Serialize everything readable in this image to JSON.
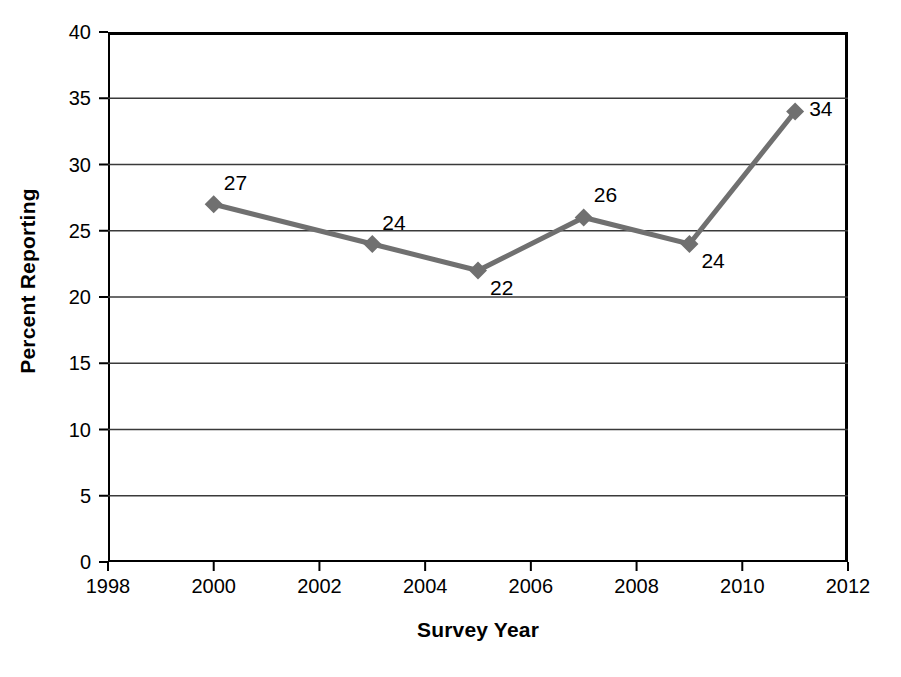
{
  "chart_data": {
    "type": "line",
    "title": "",
    "xlabel": "Survey Year",
    "ylabel": "Percent Reporting",
    "x": [
      2000,
      2003,
      2005,
      2007,
      2009,
      2011
    ],
    "values": [
      27,
      24,
      22,
      26,
      24,
      34
    ],
    "point_labels": [
      "27",
      "24",
      "22",
      "26",
      "24",
      "34"
    ],
    "xlim": [
      1998,
      2012
    ],
    "ylim": [
      0,
      40
    ],
    "xticks": [
      1998,
      2000,
      2002,
      2004,
      2006,
      2008,
      2010,
      2012
    ],
    "xtick_labels": [
      "1998",
      "2000",
      "2002",
      "2004",
      "2006",
      "2008",
      "2010",
      "2012"
    ],
    "yticks": [
      0,
      5,
      10,
      15,
      20,
      25,
      30,
      35,
      40
    ],
    "ytick_labels": [
      "0",
      "5",
      "10",
      "15",
      "20",
      "25",
      "30",
      "35",
      "40"
    ],
    "grid": "horizontal",
    "legend": "none",
    "series_color": "#707070",
    "marker": "diamond",
    "axis_color": "#000000",
    "gridline_color": "#3a3a3a"
  },
  "axes": {
    "y_title": "Percent Reporting",
    "x_title": "Survey Year"
  }
}
